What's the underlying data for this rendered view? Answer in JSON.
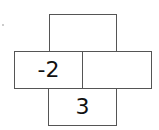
{
  "cells": {
    "top": "",
    "middle_left": "-2",
    "middle_right": "",
    "bottom": "3"
  }
}
